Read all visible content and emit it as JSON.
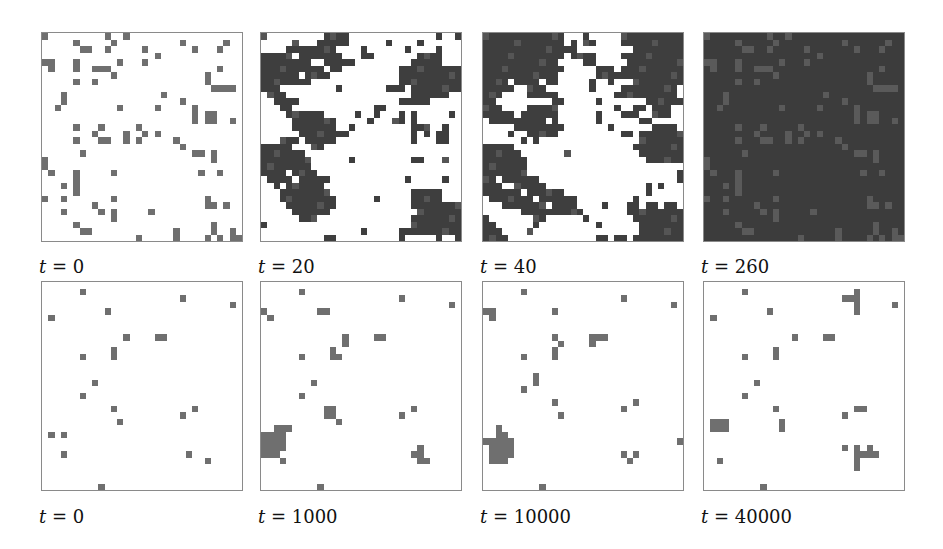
{
  "figure": {
    "rows": [
      {
        "panels": [
          {
            "label": "t = 0",
            "time": 0,
            "style": "sparse",
            "grid": [
              "#.........#..#..................",
              ".....#.....#..........#......#..",
              "......##..#.....#.......#...#...",
              "..................#.............",
              "##...#.......#..#...............",
              ".#...#..###.................#...",
              "...........#..............#.....",
              ".....#..#.................#.....",
              "...........................##...",
              "...#...............#............",
              "...#..................#.........",
              "..#.........#.....#.....#.......",
              "........................#.###...",
              "........................#.##..#.",
              ".....#...#..........#...........",
              "........#....#..#..#............",
              ".....#...##..#.#..#.............",
              "..................#.....#.......",
              "...........................##...",
              "........#.................#.....",
              "..........................##....",
              "##...........................#..",
              ".##..#.....#..............#.....",
              ".....#..........................",
              "...#.#..........................",
              "#..#...#....#..........##.#.....",
              "........#..........................",
              "...#...#..##.....#..............",
              "..........#.....................",
              ".....#.....................#.#..",
              "......##.........................",
              "...............#.........#.#..#."
            ]
          },
          {
            "label": "t = 20",
            "time": 20,
            "style": "clusters"
          },
          {
            "label": "t = 40",
            "time": 40,
            "style": "clusters"
          },
          {
            "label": "t = 260",
            "time": 260,
            "style": "inverted"
          }
        ]
      },
      {
        "panels": [
          {
            "label": "t = 0",
            "time": 0,
            "style": "sparse"
          },
          {
            "label": "t = 1000",
            "time": 1000,
            "style": "sparse"
          },
          {
            "label": "t = 10000",
            "time": 10000,
            "style": "sparse"
          },
          {
            "label": "t = 40000",
            "time": 40000,
            "style": "sparse"
          }
        ]
      }
    ],
    "colors": {
      "background": "#ffffff",
      "dark_cell": "#3e3e3e",
      "isolated_cell": "#6f6f6f",
      "inverted_background": "#3c3c3c",
      "inverted_cell": "#5a5a5a",
      "border": "#8a8a8a"
    },
    "grid_size": 32
  },
  "labels": {
    "r0p0": "t = 0",
    "r0p1": "t = 20",
    "r0p2": "t = 40",
    "r0p3": "t = 260",
    "r1p0": "t = 0",
    "r1p1": "t = 1000",
    "r1p2": "t = 10000",
    "r1p3": "t = 40000"
  },
  "panels": {
    "r0p0": [
      "#.........#..#..................",
      ".....#.....#..........#......#..",
      "......##..#.....#.......#...#...",
      "..................#.............",
      "##...#......#...#...............",
      ".#...#..###.................#...",
      "...........#..............#.....",
      ".....#..#.................#.....",
      "...........................####.",
      "...#...............#............",
      "...#..................#.........",
      "..#.........#.....#.....#.......",
      "........................#.##....",
      "........................#.##..#.",
      ".....#...#.....#................",
      "........#....#..#.#.............",
      ".....#...##..#.#.....#..........",
      "......................#.........",
      "......#.................##.#....",
      "#..........................#....",
      "#...............................",
      ".#...#.....#.............#..#...",
      ".....#..........................",
      "...#.#..........................",
      ".....#..........................",
      "#..#.......#..............#.....",
      "........#.................##.#..",
      "...#.....#.#.....#..............",
      "...........#....................",
      ".....#.....................#....",
      "......##.............#.....#..#.",
      "...............#.....#....#.#.##"
    ],
    "r0p1": [
      "#.........####..............#..#",
      ".....#...#####......#....#......",
      "....########....#......#....#...",
      "#####.#######...##.......####...",
      "########..#####.........#####...",
      "##########.##.........##########",
      "######.####...........##########",
      "########..............##########",
      "###.........#.......###.########",
      ".###....................######..",
      "..####................#####.....",
      "...##.............##............",
      "....######.....#..#...#.#.....#.",
      ".....#######.....#...##.#.......",
      ".....#######..#.........###..#..",
      "......########..........#.#.##..",
      "...###.#####............#...##..",
      "#####...##..........................",
      "#######.........................",
      "########......#.........##...#..",
      "########........................",
      "####.####.......................",
      ".####.#####............#.....#..",
      "..#.######......................",
      "...########.............#####...",
      "...#########......#.....#####...",
      "....########............#########",
      ".....######..............########",
      "......###...............##########",
      "#.......................##########",
      "................#.....##########",
      "..........##..........#.....#..#"
    ],
    "r0p2": [
      "#############...#.....##########",
      "#############.#.##....##########",
      "###############.........#########",
      "#############.####....##########",
      "############....##.....#########",
      "#############.....###.##########",
      "############......##############",
      "####.####.##.....#..#...########",
      "#####..###.......#....#########.",
      "###....#####.........##########.",
      "##.........##.....#.......######",
      "###....#####.........#..##.###..",
      "#####.######......#...###..###..",
      ".#########.#......#......##.....",
      ".....########.......#......####.",
      "....#..#####..........##.#######",
      "......#.#................#######",
      "#####...................########",
      "######.......#...........#######",
      "#######...................######",
      "#######...........................",
      "#######........................#",
      "##.######......................#",
      "###..#####................#.#...",
      "######.######.............#.....",
      ".#######.######.........#.......",
      "...#######.####....#...##.##.##.",
      "......##########.......#########",
      "#.......##......#.......########",
      "##......#.........#......#######",
      "###....#.................#######",
      "####..............##.##.########"
    ],
    "r0p3": [
      "#.........#..#..................",
      ".....#.....#..........#......#..",
      "......##..#.....#.......#...#...",
      "..................#.............",
      "##...#......#...#...............",
      ".#...#..###.................#...",
      "...........#..............#.....",
      ".....#..#.................#.....",
      "...........................####.",
      "...#...............#............",
      "...#..................#.........",
      "..#.........#.....#.....#.......",
      "........................#.##....",
      "........................#.##..#.",
      ".....#...#.....#................",
      "........#....#..#.#.............",
      ".....#...##..#.#.....#..........",
      "......................#.........",
      "......#.................##.#....",
      "#..........................#....",
      "#...............................",
      ".#...#.....#.............#..#...",
      ".....#..........................",
      "...#.#..........................",
      ".....#..........................",
      "#..#.......#..............#.....",
      "........#.................##.#..",
      "...#.....#.#.....#..............",
      "...........#....................",
      ".....#.....................#....",
      "......##.............#.....#..#.",
      "...............#.....#....#.#.##"
    ],
    "r1p0": [
      "................................",
      "......#.........................",
      "......................#.........",
      "..............................#.",
      "..........#.....................",
      ".#..............................",
      "................................",
      "................................",
      ".............#....##............",
      "................................",
      "...........#....................",
      "......#....#....................",
      "................................",
      "................................",
      "................................",
      "........#.......................",
      "................................",
      "......#.........................",
      "................................",
      "...........#............#.......",
      "......................#.........",
      "............#...................",
      "................................",
      ".#.#............................",
      "................................",
      "................................",
      "...#...................#........",
      "..........................#.....",
      "................................",
      "................................",
      "................................",
      ".........#......................"
    ],
    "r1p1": [
      "................................",
      "......#.........................",
      "......................#.........",
      "..............................#.",
      "#........##.....................",
      ".#..............................",
      "................................",
      "................................",
      ".............#....##............",
      ".............#..................",
      "...........#....................",
      "......#....##...................",
      "................................",
      "................................",
      "................................",
      "........#.......................",
      "................................",
      "......#.........................",
      "................................",
      "..........##............#.......",
      "..........##..........#.........",
      "............#...................",
      "..###...........................",
      "####............................",
      "####............................",
      "####.....................#......",
      "###.....................##......",
      "...#.....................##.....",
      "................................",
      "................................",
      "................................",
      ".........#......................"
    ],
    "r1p2": [
      "................................",
      "......#.........................",
      "......................#.........",
      "..............................#.",
      "##.........#....................",
      ".#..............................",
      "................................",
      "................................",
      "...........#.....###............",
      "............#....#..............",
      "...........#....................",
      "......#....#....................",
      "................................",
      "................................",
      "........#.......................",
      "........#.......................",
      "......#.........................",
      "................................",
      "...........#............#.......",
      "......................#.........",
      "............#...................",
      "................................",
      "..#.............................",
      "..##............................",
      "#####..........................#",
      ".####...........................",
      ".####.................#.#.......",
      ".###...................#........",
      "................................",
      "................................",
      "................................",
      ".........#......................"
    ],
    "r1p3": [
      "................................",
      "......#.................#.......",
      "......................###.......",
      "........................#.....#.",
      "..........#.............#.......",
      ".#..............................",
      "................................",
      "................................",
      "..............#....##...........",
      "................................",
      "...........#....................",
      "......#....#....................",
      "................................",
      "................................",
      "................................",
      "........#.......................",
      "................................",
      "......#.........................",
      "................................",
      "...........#............##......",
      "......................#.........",
      ".###........#...................",
      ".###........#...................",
      "................................",
      "................................",
      "......................#.#.#.....",
      "........................####....",
      "..#.....................#.......",
      "........................#.......",
      "................................",
      "................................",
      ".........#......................"
    ]
  },
  "layout": {
    "col_x": [
      41,
      260,
      482,
      703
    ],
    "row_y": [
      32,
      281
    ],
    "panel_w": 202,
    "panel_h": 210,
    "label_y": [
      256,
      506
    ]
  }
}
